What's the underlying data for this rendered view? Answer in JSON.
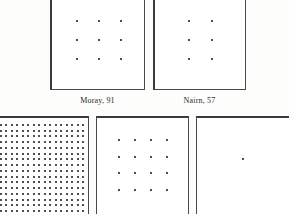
{
  "plate": {
    "background_color": "#fdfdfb",
    "ink_color": "#151515",
    "rule_color": "#4a4a4a"
  },
  "panels": [
    {
      "id": "moray",
      "name": "panel-moray",
      "rows": 3,
      "cols": 3,
      "dot_count": 9,
      "dot_size": 2,
      "caption_place": "Moray",
      "caption_value": "91",
      "caption_text": "Moray, 91"
    },
    {
      "id": "nairn",
      "name": "panel-nairn",
      "rows": 3,
      "cols": 2,
      "dot_count": 6,
      "dot_size": 2,
      "caption_place": "Nairn",
      "caption_value": "57",
      "caption_text": "Nairn, 57"
    },
    {
      "id": "dense",
      "name": "panel-dense",
      "rows": 16,
      "cols": 16,
      "dot_count": 256,
      "dot_size": 2,
      "caption_place": "",
      "caption_value": "",
      "caption_text": ""
    },
    {
      "id": "medium",
      "name": "panel-medium",
      "rows": 4,
      "cols": 4,
      "dot_count": 16,
      "dot_size": 2,
      "caption_place": "",
      "caption_value": "",
      "caption_text": ""
    },
    {
      "id": "single",
      "name": "panel-single",
      "rows": 1,
      "cols": 1,
      "dot_count": 1,
      "dot_size": 2,
      "caption_place": "",
      "caption_value": "",
      "caption_text": ""
    }
  ],
  "captions": [
    {
      "text": "Moray, 91",
      "place": "Moray",
      "separator": ", ",
      "value": "91"
    },
    {
      "text": "Nairn, 57",
      "place": "Nairn",
      "separator": ", ",
      "value": "57"
    }
  ]
}
